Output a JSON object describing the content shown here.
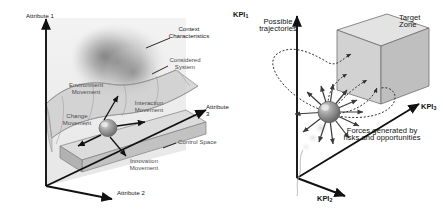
{
  "figure": {
    "background": "#ffffff"
  },
  "colors": {
    "ink": "#141414",
    "axis": "#111111",
    "surface_fill": "#c9c9c9",
    "surface_stroke": "#8a8a8a",
    "slab_top": "#d8d8d8",
    "slab_side": "#c0c0c0",
    "cloud": "#9a9a9a",
    "sphere": "#8f8f8f",
    "dotted": "#3a3a3a",
    "cube_front": "#d2d2d2",
    "cube_top": "#e2e2e2",
    "cube_side": "#bdbdbd",
    "label_grey": "#4a4a4a"
  },
  "left_panel": {
    "name": "control-space-diagram",
    "axes": [
      {
        "id": "attribute-1",
        "label": "Attribute 1",
        "orientation": "vertical"
      },
      {
        "id": "attribute-2",
        "label": "Attribute 2",
        "orientation": "depth"
      },
      {
        "id": "attribute-3",
        "label": "Attribute 3",
        "orientation": "horizontal"
      }
    ],
    "annotations": [
      {
        "id": "context-characteristics",
        "label": "Context\nCharacteristics",
        "leader": true
      },
      {
        "id": "considered-system",
        "label": "Considered\nSystem",
        "leader": true
      },
      {
        "id": "environment-movement",
        "label": "Environment\nMovement",
        "leader": false
      },
      {
        "id": "change-movement",
        "label": "Change\nMovement",
        "leader": true
      },
      {
        "id": "interaction-movement",
        "label": "Interaction\nMovement",
        "leader": true
      },
      {
        "id": "innovation-movement",
        "label": "Innovation\nMovement",
        "leader": true
      },
      {
        "id": "control-space",
        "label": "Control Space",
        "leader": true
      }
    ]
  },
  "right_panel": {
    "name": "kpi-trajectory-diagram",
    "axes": [
      {
        "id": "kpi-1",
        "label": "KPI",
        "subscript": "1",
        "orientation": "vertical"
      },
      {
        "id": "kpi-2",
        "label": "KPI",
        "subscript": "2",
        "orientation": "depth"
      },
      {
        "id": "kpi-3",
        "label": "KPI",
        "subscript": "3",
        "orientation": "horizontal"
      }
    ],
    "annotations": [
      {
        "id": "possible-trajectories",
        "label": "Possible\ntrajectories",
        "leader": false
      },
      {
        "id": "target-zone",
        "label": "Target\nZone",
        "leader": false
      },
      {
        "id": "forces-caption",
        "label": "Forces generated by\nrisks and opportunities",
        "leader": false
      }
    ]
  }
}
